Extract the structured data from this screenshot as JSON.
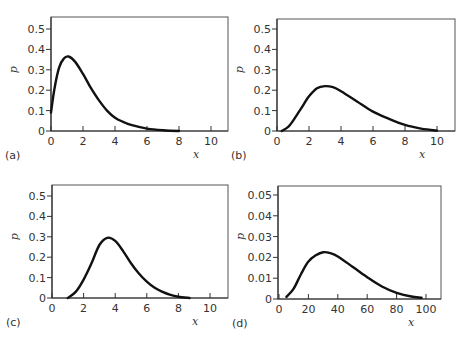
{
  "chart_data": [
    {
      "type": "line",
      "panel_label": "(a)",
      "xlabel": "x",
      "ylabel": "p",
      "xlim": [
        0,
        11.1
      ],
      "ylim": [
        0,
        0.53
      ],
      "xticks": [
        0,
        2,
        4,
        6,
        8,
        10
      ],
      "yticks": [
        0,
        0.1,
        0.2,
        0.3,
        0.4,
        0.5
      ],
      "ytick_labels": [
        "0",
        "0.1",
        "0.2",
        "0.3",
        "0.4",
        "0.5"
      ],
      "grid": false,
      "box": {
        "left": 51,
        "top": 17,
        "right": 228,
        "bottom": 131,
        "x0px": 51,
        "xscale": 16,
        "y0px": 131,
        "yscale": 204
      },
      "x": [
        0,
        0.2,
        0.5,
        0.8,
        1.1,
        1.5,
        2,
        2.5,
        3,
        3.5,
        4,
        4.5,
        5,
        6,
        7,
        8
      ],
      "y": [
        0.09,
        0.2,
        0.31,
        0.355,
        0.365,
        0.34,
        0.28,
        0.21,
        0.15,
        0.1,
        0.065,
        0.045,
        0.03,
        0.012,
        0.004,
        0.0
      ]
    },
    {
      "type": "line",
      "panel_label": "(b)",
      "xlabel": "x",
      "ylabel": "p",
      "xlim": [
        0,
        11.1
      ],
      "ylim": [
        0,
        0.55
      ],
      "xticks": [
        0,
        2,
        4,
        6,
        8,
        10
      ],
      "yticks": [
        0,
        0.1,
        0.2,
        0.3,
        0.4,
        0.5
      ],
      "ytick_labels": [
        "0",
        "0.1",
        "0.2",
        "0.3",
        "0.4",
        "0.5"
      ],
      "grid": false,
      "box": {
        "left": 277,
        "top": 19,
        "right": 455,
        "bottom": 131,
        "x0px": 277,
        "xscale": 16,
        "y0px": 131,
        "yscale": 204
      },
      "x": [
        0.3,
        0.7,
        1,
        1.5,
        2,
        2.5,
        3,
        3.5,
        4,
        5,
        6,
        7,
        8,
        9,
        10
      ],
      "y": [
        0,
        0.02,
        0.05,
        0.11,
        0.17,
        0.21,
        0.22,
        0.215,
        0.195,
        0.145,
        0.095,
        0.06,
        0.03,
        0.012,
        0.002
      ]
    },
    {
      "type": "line",
      "panel_label": "(c)",
      "xlabel": "x",
      "ylabel": "p",
      "xlim": [
        0,
        11.1
      ],
      "ylim": [
        0,
        0.55
      ],
      "xticks": [
        0,
        2,
        4,
        6,
        8,
        10
      ],
      "yticks": [
        0,
        0.1,
        0.2,
        0.3,
        0.4,
        0.5
      ],
      "ytick_labels": [
        "0",
        "0.1",
        "0.2",
        "0.3",
        "0.4",
        "0.5"
      ],
      "grid": false,
      "box": {
        "left": 52,
        "top": 185,
        "right": 228,
        "bottom": 298,
        "x0px": 52,
        "xscale": 15.8,
        "y0px": 298,
        "yscale": 204
      },
      "x": [
        1,
        1.5,
        2,
        2.5,
        3,
        3.5,
        4,
        4.5,
        5,
        5.5,
        6,
        6.5,
        7,
        7.5,
        8,
        8.7
      ],
      "y": [
        0,
        0.03,
        0.09,
        0.17,
        0.26,
        0.295,
        0.28,
        0.23,
        0.17,
        0.12,
        0.08,
        0.05,
        0.03,
        0.015,
        0.006,
        0.0
      ]
    },
    {
      "type": "line",
      "panel_label": "(d)",
      "xlabel": "x",
      "ylabel": "p",
      "xlim": [
        0,
        110
      ],
      "ylim": [
        0,
        0.055
      ],
      "xticks": [
        0,
        20,
        40,
        60,
        80,
        100
      ],
      "yticks": [
        0,
        0.01,
        0.02,
        0.03,
        0.04,
        0.05
      ],
      "ytick_labels": [
        "0",
        "0.01",
        "0.02",
        "0.03",
        "0.04",
        "0.05"
      ],
      "grid": false,
      "box": {
        "left": 278,
        "top": 186,
        "right": 441,
        "bottom": 299,
        "x0px": 279,
        "xscale": 1.47,
        "y0px": 299,
        "yscale": 2080
      },
      "x": [
        5,
        10,
        15,
        20,
        25,
        30,
        35,
        40,
        50,
        60,
        70,
        80,
        90,
        97
      ],
      "y": [
        0.001,
        0.005,
        0.012,
        0.018,
        0.021,
        0.0225,
        0.022,
        0.0205,
        0.0155,
        0.0105,
        0.006,
        0.003,
        0.0012,
        0.0006
      ]
    }
  ]
}
